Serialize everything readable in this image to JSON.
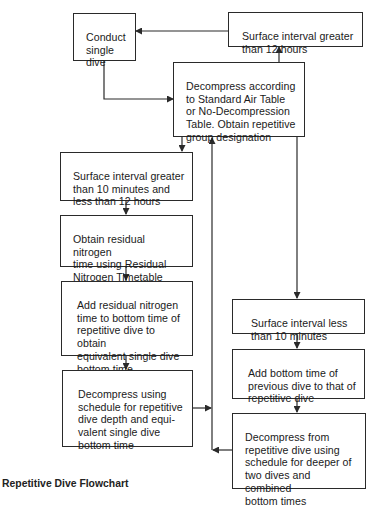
{
  "caption": "Repetitive Dive Flowchart",
  "colors": {
    "line": "#2a2a2a",
    "text": "#1a1a1a",
    "background": "#ffffff"
  },
  "nodes": {
    "conduct_single_dive": {
      "label": "Conduct\nsingle\ndive"
    },
    "surface_gt_12h": {
      "label": "Surface interval greater\nthan 12 hours"
    },
    "decompress_standard": {
      "label": "Decompress according\nto Standard Air Table\nor No-Decompression\nTable. Obtain repetitive\ngroup designation"
    },
    "surface_10m_12h": {
      "label": "Surface interval greater\nthan 10 minutes and\nless than 12 hours"
    },
    "obtain_residual": {
      "label": "Obtain residual nitrogen\ntime using Residual\nNitrogen Timetable"
    },
    "add_residual": {
      "label": "Add residual nitrogen\ntime to bottom time of\nrepetitive dive to obtain\nequivalent single dive\nbottom time"
    },
    "decompress_repetitive_schedule": {
      "label": "Decompress using\nschedule for repetitive\ndive depth and equi-\nvalent single dive\nbottom time"
    },
    "surface_lt_10m": {
      "label": "Surface interval less\nthan 10 minutes"
    },
    "add_bottom_time": {
      "label": "Add bottom time of\nprevious dive to that of\nrepetitive dive"
    },
    "decompress_deeper": {
      "label": "Decompress from\nrepetitive dive using\nschedule for deeper of\ntwo dives and combined\nbottom times"
    }
  },
  "edges": [
    {
      "from": "conduct_single_dive",
      "to": "decompress_standard"
    },
    {
      "from": "decompress_standard",
      "to": "surface_gt_12h"
    },
    {
      "from": "surface_gt_12h",
      "to": "conduct_single_dive"
    },
    {
      "from": "decompress_standard",
      "to": "surface_10m_12h"
    },
    {
      "from": "decompress_standard",
      "to": "surface_lt_10m"
    },
    {
      "from": "surface_10m_12h",
      "to": "obtain_residual"
    },
    {
      "from": "obtain_residual",
      "to": "add_residual"
    },
    {
      "from": "add_residual",
      "to": "decompress_repetitive_schedule"
    },
    {
      "from": "decompress_repetitive_schedule",
      "to": "decompress_standard"
    },
    {
      "from": "surface_lt_10m",
      "to": "add_bottom_time"
    },
    {
      "from": "add_bottom_time",
      "to": "decompress_deeper"
    },
    {
      "from": "decompress_deeper",
      "to": "decompress_standard"
    }
  ]
}
